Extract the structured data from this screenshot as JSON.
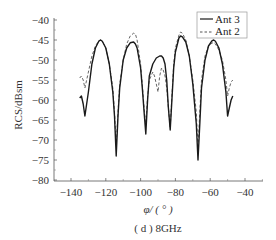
{
  "chart_data": {
    "type": "line",
    "title": "",
    "caption": "( d ) 8GHz",
    "xlabel": "φ/ ( ° )",
    "ylabel": "RCS/dBsm",
    "xlim": [
      -145,
      -35
    ],
    "ylim": [
      -80,
      -40
    ],
    "xticks": [
      -140,
      -120,
      -100,
      -80,
      -60,
      -40
    ],
    "xtick_labels": [
      "−140",
      "−120",
      "−100",
      "−80",
      "−60",
      "−40"
    ],
    "yticks": [
      -40,
      -45,
      -50,
      -55,
      -60,
      -65,
      -70,
      -75,
      -80
    ],
    "ytick_labels": [
      "−40",
      "−45",
      "−50",
      "−55",
      "−60",
      "−65",
      "−70",
      "−75",
      "−80"
    ],
    "grid": false,
    "legend_position": "upper right",
    "series": [
      {
        "name": "Ant 3",
        "style": "solid",
        "color": "#1a1a1a",
        "x": [
          -135,
          -134,
          -133,
          -132,
          -130,
          -128,
          -126,
          -124,
          -123,
          -122,
          -120,
          -118,
          -116,
          -115,
          -114,
          -113,
          -112,
          -110,
          -108,
          -106,
          -104,
          -103,
          -102,
          -100,
          -99,
          -98,
          -97,
          -96,
          -95,
          -93,
          -91,
          -89,
          -88,
          -87,
          -86,
          -85,
          -84,
          -83,
          -82,
          -81,
          -80,
          -78,
          -77,
          -76,
          -74,
          -72,
          -70,
          -68,
          -67,
          -66,
          -65,
          -63,
          -61,
          -59,
          -58,
          -57,
          -55,
          -53,
          -51,
          -50,
          -49,
          -48,
          -47
        ],
        "y": [
          -59.5,
          -59,
          -61,
          -64,
          -58,
          -51,
          -47,
          -45.3,
          -45,
          -45.3,
          -47,
          -51,
          -58,
          -64,
          -74,
          -64,
          -57,
          -50,
          -47,
          -45.7,
          -45.5,
          -46,
          -47,
          -52,
          -57,
          -63,
          -68.5,
          -60,
          -54,
          -51,
          -49.5,
          -49,
          -49,
          -49.5,
          -51,
          -55,
          -62,
          -67.5,
          -60,
          -52,
          -48,
          -44.5,
          -44,
          -44.2,
          -45.5,
          -49,
          -56,
          -66,
          -75,
          -66,
          -57,
          -50,
          -46.5,
          -45.2,
          -45,
          -45.3,
          -47,
          -51,
          -58,
          -64,
          -62,
          -60,
          -59
        ]
      },
      {
        "name": "Ant 2",
        "style": "dashed",
        "color": "#555555",
        "x": [
          -135,
          -134,
          -133,
          -132,
          -130,
          -128,
          -126,
          -124,
          -123,
          -122,
          -120,
          -118,
          -116,
          -115,
          -114,
          -113,
          -112,
          -110,
          -108,
          -106,
          -104,
          -103,
          -102,
          -100,
          -99,
          -98,
          -97,
          -96,
          -95,
          -93,
          -92,
          -91,
          -90,
          -89,
          -88,
          -87,
          -86,
          -85,
          -84,
          -83,
          -82,
          -81,
          -80,
          -78,
          -77,
          -76,
          -74,
          -72,
          -70,
          -68,
          -67,
          -66,
          -65,
          -63,
          -61,
          -59,
          -58,
          -57,
          -55,
          -53,
          -51,
          -50,
          -49,
          -48,
          -47
        ],
        "y": [
          -54.5,
          -54,
          -55,
          -57,
          -53,
          -49,
          -46.5,
          -45.2,
          -45,
          -45.3,
          -47,
          -51,
          -57,
          -63,
          -71,
          -63,
          -56,
          -50,
          -46,
          -44,
          -43.3,
          -43.5,
          -45,
          -51,
          -56,
          -62,
          -66,
          -59,
          -55,
          -53,
          -54,
          -56,
          -58,
          -54,
          -52,
          -52.5,
          -54,
          -57,
          -62,
          -67,
          -59,
          -51,
          -47,
          -43.8,
          -43,
          -43.3,
          -45,
          -49,
          -55,
          -63,
          -72,
          -63,
          -55,
          -49,
          -46.5,
          -45.8,
          -45.6,
          -46,
          -47.5,
          -50,
          -55,
          -59,
          -57,
          -55.5,
          -55
        ]
      }
    ]
  },
  "legend": {
    "items": [
      {
        "label": "Ant 3",
        "style": "solid"
      },
      {
        "label": "Ant 2",
        "style": "dashed"
      }
    ]
  },
  "axes": {
    "ylabel": "RCS/dBsm",
    "xlabel": "φ/ ( ° )",
    "caption": "( d ) 8GHz"
  }
}
